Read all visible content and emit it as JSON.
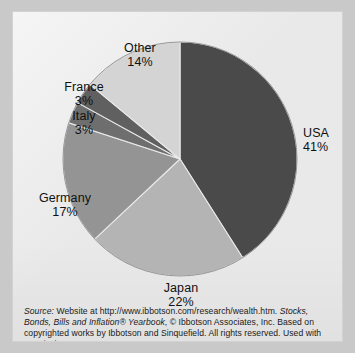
{
  "figure": {
    "background_color": "#e9e9e9",
    "page_color": "#c9c9c9"
  },
  "chart_data": {
    "type": "pie",
    "title": "",
    "categories": [
      "USA",
      "Japan",
      "Germany",
      "Italy",
      "France",
      "Other"
    ],
    "values": [
      41,
      22,
      17,
      3,
      3,
      14
    ],
    "unit": "percent",
    "start_angle_deg": 0,
    "direction": "clockwise",
    "legend": "none",
    "labels_position": "outside",
    "slices": [
      {
        "name": "USA",
        "label": "USA",
        "value": "41%",
        "pct": 41,
        "color": "#4a4a4a"
      },
      {
        "name": "Japan",
        "label": "Japan",
        "value": "22%",
        "pct": 22,
        "color": "#b4b4b4"
      },
      {
        "name": "Germany",
        "label": "Germany",
        "value": "17%",
        "pct": 17,
        "color": "#949494"
      },
      {
        "name": "Italy",
        "label": "Italy",
        "value": "3%",
        "pct": 3,
        "color": "#6e6e6e"
      },
      {
        "name": "France",
        "label": "France",
        "value": "3%",
        "pct": 3,
        "color": "#606060"
      },
      {
        "name": "Other",
        "label": "Other",
        "value": "14%",
        "pct": 14,
        "color": "#d4d4d4"
      }
    ]
  },
  "caption": {
    "source_word": "Source:",
    "line1_rest": " Website at http://www.ibbotson.com/research/wealth.htm. ",
    "title_part1": "Stocks, Bonds,",
    "title_part2": "Bills and Inflation® Yearbook",
    "line2_rest": ", © Ibbotson Associates, Inc. Based on copyrighted",
    "line3": "works by Ibbotson and Sinquefield. All rights reserved. Used with permission.",
    "full_text": "Source: Website at http://www.ibbotson.com/research/wealth.htm. Stocks, Bonds, Bills and Inflation® Yearbook, © Ibbotson Associates, Inc. Based on copyrighted works by Ibbotson and Sinquefield. All rights reserved. Used with permission."
  }
}
